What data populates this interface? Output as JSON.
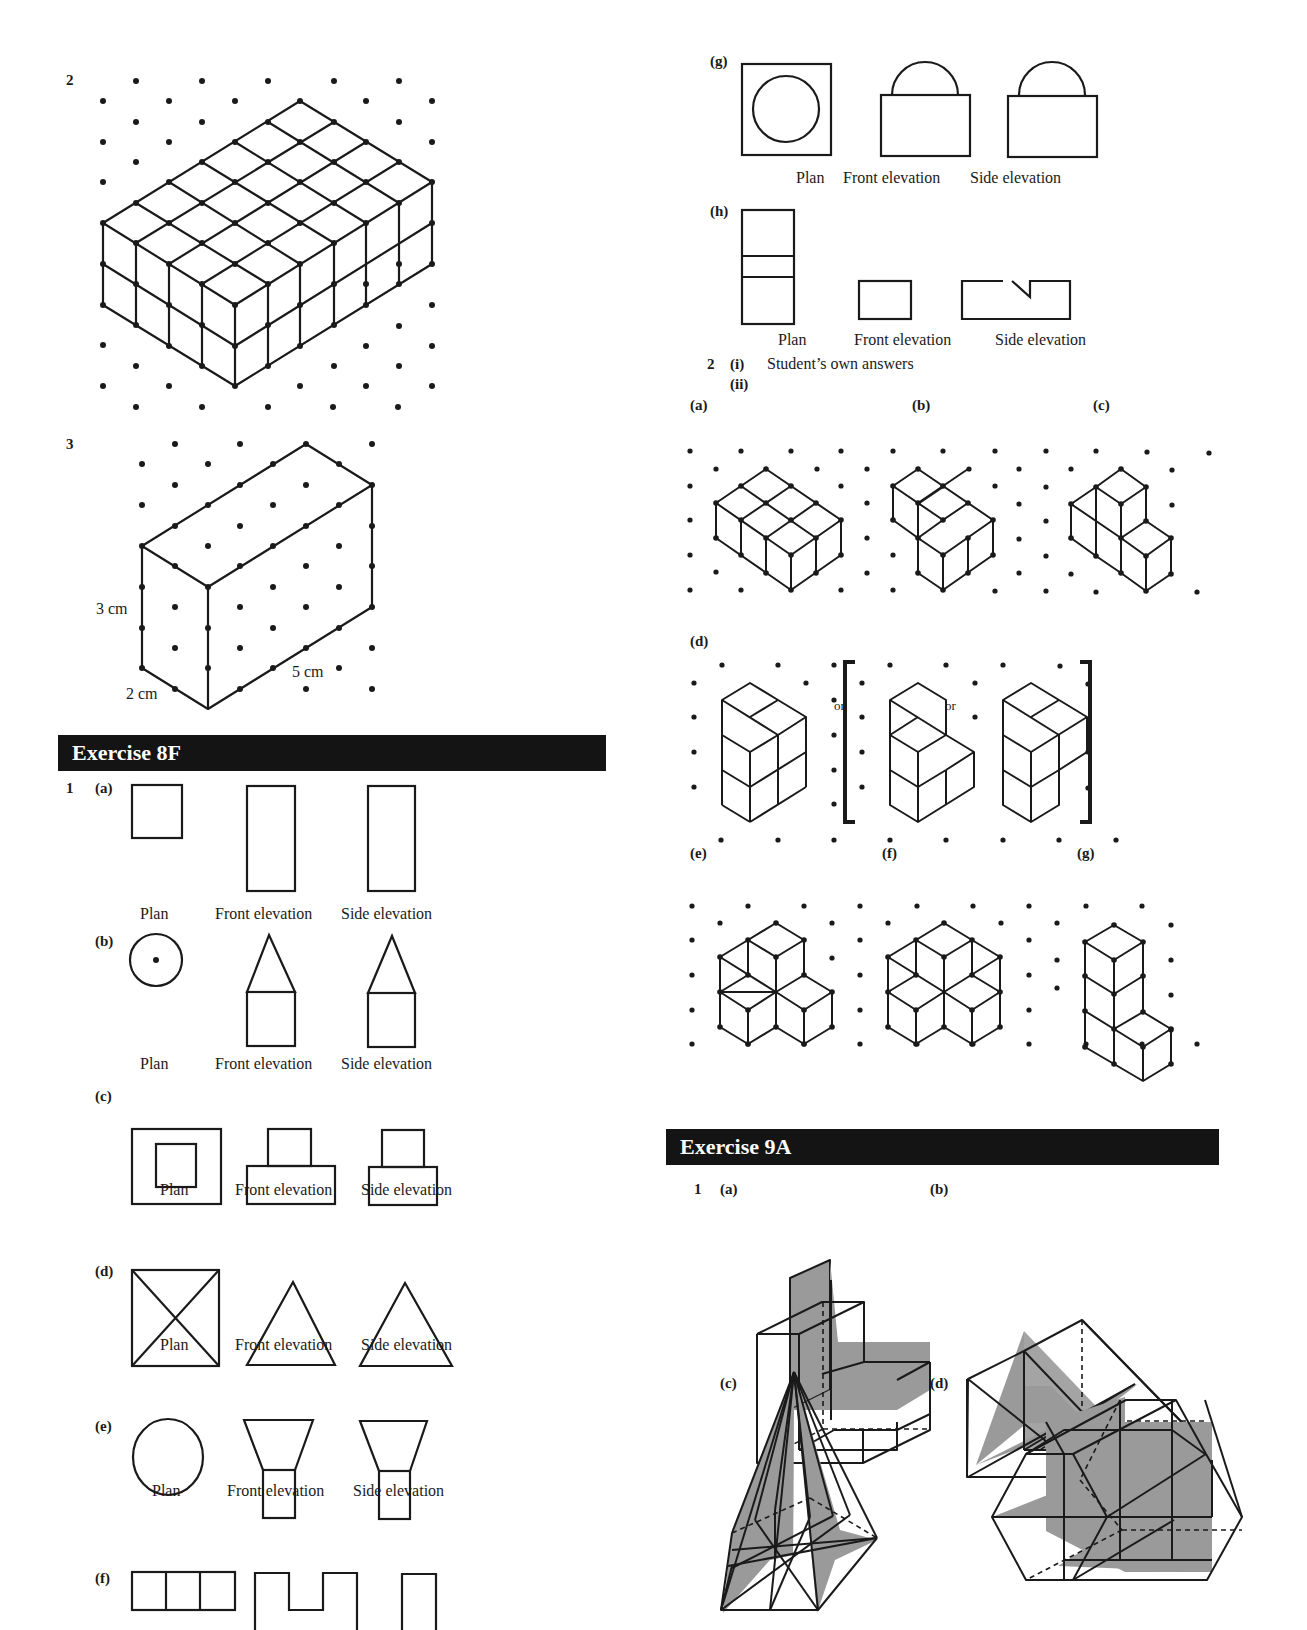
{
  "page_header": {
    "page_number": "222",
    "section": "Answers"
  },
  "left_column": {
    "q2": {
      "number": "2"
    },
    "q3": {
      "number": "3",
      "dim_height": "3 cm",
      "dim_depth": "2 cm",
      "dim_length": "5 cm"
    },
    "exercise_8f": {
      "title": "Exercise  8F",
      "q1": {
        "number": "1",
        "parts": [
          {
            "label": "(a)",
            "plan": "Plan",
            "front": "Front elevation",
            "side": "Side elevation"
          },
          {
            "label": "(b)",
            "plan": "Plan",
            "front": "Front elevation",
            "side": "Side elevation"
          },
          {
            "label": "(c)",
            "plan": "Plan",
            "front": "Front elevation",
            "side": "Side elevation"
          },
          {
            "label": "(d)",
            "plan": "Plan",
            "front": "Front elevation",
            "side": "Side elevation"
          },
          {
            "label": "(e)",
            "plan": "Plan",
            "front": "Front elevation",
            "side": "Side elevation"
          },
          {
            "label": "(f)"
          }
        ]
      }
    }
  },
  "right_column": {
    "q1g": {
      "label": "(g)",
      "plan": "Plan",
      "front": "Front elevation",
      "side": "Side elevation"
    },
    "q1h": {
      "label": "(h)",
      "plan": "Plan",
      "front": "Front elevation",
      "side": "Side elevation"
    },
    "q2": {
      "number": "2",
      "i_label": "(i)",
      "i_text": "Student’s own answers",
      "ii_label": "(ii)",
      "parts": [
        "(a)",
        "(b)",
        "(c)",
        "(d)",
        "(e)",
        "(f)",
        "(g)"
      ],
      "or_text": "or"
    },
    "exercise_9a": {
      "title": "Exercise  9A",
      "q1": {
        "number": "1",
        "parts": [
          "(a)",
          "(b)",
          "(c)",
          "(d)"
        ]
      }
    }
  },
  "colors": {
    "ink": "#1a1a1a",
    "banner_bg": "#141414",
    "shade": "#9a9a9a"
  }
}
